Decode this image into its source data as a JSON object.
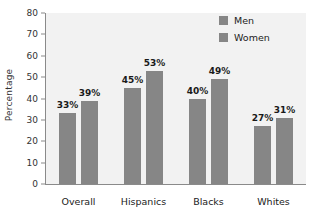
{
  "chart_data": {
    "type": "bar",
    "title": "",
    "xlabel": "",
    "ylabel": "Percentage",
    "ylim": [
      0,
      80
    ],
    "ytick_step": 10,
    "yticks": [
      "80",
      "70",
      "60",
      "50",
      "40",
      "30",
      "20",
      "10",
      "0"
    ],
    "grid": false,
    "legend_position": "top-right",
    "categories": [
      "Overall",
      "Hispanics",
      "Blacks",
      "Whites"
    ],
    "series": [
      {
        "name": "Men",
        "color": "#868686",
        "values": [
          33,
          45,
          40,
          27
        ],
        "labels": [
          "33%",
          "45%",
          "40%",
          "27%"
        ]
      },
      {
        "name": "Women",
        "color": "#868686",
        "values": [
          39,
          53,
          49,
          31
        ],
        "labels": [
          "39%",
          "53%",
          "49%",
          "31%"
        ]
      }
    ]
  },
  "legend": {
    "items": [
      {
        "label": "Men"
      },
      {
        "label": "Women"
      }
    ]
  },
  "colors": {
    "bar": "#868686",
    "plot_background": "#f2f2f2",
    "axis": "#8a8a8a",
    "text": "#222222"
  }
}
